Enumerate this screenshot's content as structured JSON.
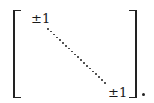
{
  "matrix": {
    "type": "diagonal",
    "top_left_entry": "±1",
    "bottom_right_entry": "±1",
    "diagonal_ellipsis": "dotted",
    "trailing_punctuation": "."
  }
}
